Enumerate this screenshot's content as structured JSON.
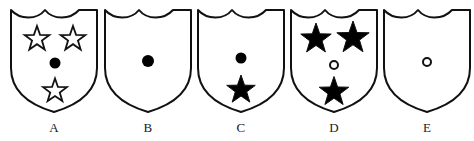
{
  "figure": {
    "background_color": "#ffffff",
    "stroke_color": "#111111",
    "fill_color": "#000000",
    "shield_fill": "#ffffff",
    "stroke_width": 2
  },
  "shields": [
    {
      "label": "A",
      "x": 7,
      "charges": [
        {
          "type": "star",
          "style": "outline",
          "x": 30,
          "y": 33,
          "size": 26
        },
        {
          "type": "star",
          "style": "outline",
          "x": 66,
          "y": 33,
          "size": 26
        },
        {
          "type": "circle",
          "style": "filled",
          "x": 48,
          "y": 57,
          "size": 11
        },
        {
          "type": "star",
          "style": "outline",
          "x": 48,
          "y": 85,
          "size": 25
        }
      ]
    },
    {
      "label": "B",
      "x": 101,
      "charges": [
        {
          "type": "circle",
          "style": "filled",
          "x": 47,
          "y": 55,
          "size": 12
        }
      ]
    },
    {
      "label": "C",
      "x": 194,
      "charges": [
        {
          "type": "circle",
          "style": "filled",
          "x": 47,
          "y": 52,
          "size": 11
        },
        {
          "type": "star",
          "style": "filled",
          "x": 47,
          "y": 84,
          "size": 30
        }
      ]
    },
    {
      "label": "D",
      "x": 287,
      "charges": [
        {
          "type": "star",
          "style": "filled",
          "x": 29,
          "y": 33,
          "size": 32
        },
        {
          "type": "star",
          "style": "filled",
          "x": 66,
          "y": 32,
          "size": 34
        },
        {
          "type": "circle",
          "style": "outline",
          "x": 47,
          "y": 59,
          "size": 10
        },
        {
          "type": "star",
          "style": "filled",
          "x": 47,
          "y": 86,
          "size": 31
        }
      ]
    },
    {
      "label": "E",
      "x": 380,
      "charges": [
        {
          "type": "circle",
          "style": "outline",
          "x": 47,
          "y": 56,
          "size": 10
        }
      ]
    }
  ]
}
